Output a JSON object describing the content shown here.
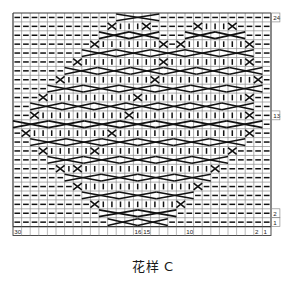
{
  "figure": {
    "caption": "花样 C",
    "type": "knitting-stitch-chart",
    "title_label": "花样 C"
  },
  "chart_data": {
    "type": "heatmap",
    "title": "花样 C",
    "subtitle": "",
    "xlabel": "",
    "ylabel": "",
    "grid": true,
    "legend_position": "none",
    "columns": 30,
    "rows": 24,
    "cell_width": 8.6,
    "cell_height": 8.9,
    "origin_x": 13,
    "origin_y": 13,
    "axis_note": "Stitch columns numbered right-to-left 1..30; rows numbered bottom-to-top 1..24",
    "colors": {
      "grid_line": "#8c8c8c",
      "grid_line_major": "#3a3a3a",
      "symbol": "#111111",
      "background": "#ffffff",
      "label_text": "#1a1a1a"
    },
    "column_tick_labels": [
      {
        "text": "30",
        "column": 30
      },
      {
        "text": "16",
        "column": 16
      },
      {
        "text": "15",
        "column": 15
      },
      {
        "text": "10",
        "column": 10
      },
      {
        "text": "2",
        "column": 2
      },
      {
        "text": "1",
        "column": 1
      }
    ],
    "row_tick_labels": [
      {
        "text": "24",
        "row": 24
      },
      {
        "text": "13",
        "row": 13
      },
      {
        "text": "2",
        "row": 2
      },
      {
        "text": "1",
        "row": 1
      }
    ],
    "symbols_legend": [
      {
        "key": "purl",
        "glyph": "dash",
        "description": "horizontal dash — purl stitch"
      },
      {
        "key": "knit",
        "glyph": "bar",
        "description": "vertical bar — knit stitch"
      },
      {
        "key": "cable",
        "glyph": "cross",
        "description": "crossing lines — cable cross over 4 stitches"
      }
    ],
    "cells": [
      "------------KXXXK-------------",
      "-----------K|||K-----K|||K----",
      "----------KXXXXXK---KXXXXXK---",
      "---------K|||||||K-K|||||||K--",
      "--------KXXXXXXXXKXXXXXXXXXK--",
      "-------K|||||||||K|||||||||K--",
      "------KXXXXXXXXXXKXXXXXXXXXXK-",
      "-----K||||||||||K|||||||||||K-",
      "----KXXXXXXXXXXKXXXXXXXXXXXXK",
      "---K||||||||||K||||||||||||K--",
      "--KXXXXXXXXXXKXXXXXXXXXXXXXK--",
      "--K||||||||||K|||||||||||||K--",
      "KXXXXXXXXXXXKXXXXXXXXXXXXXXXK",
      "-K|||||||||K|||||||||||||||K--",
      "--KXXXXXXXKXXXXXXXXXXXXXXXK---",
      "---K|||||K|||||||||||||||K----",
      "----KXXXKXXXXXXXXXXXXXXXK-----",
      "-----K|K|||||||||||||||K------",
      "------KXXXXXXXXXXXXXXXK-------",
      "-------K|||||||||||||K--------",
      "--------KXXXXXXXXXXXK---------",
      "---------K|||||||||K----------",
      "----------KXXXXXXXK-----------",
      "-----------KXXXXXK------------"
    ],
    "cable_crossings_description": "Large X cable crosses spanning 4 stitch columns, arranged in two mirrored diamond/lattice motifs repeating across 30 stitches and 24 rows",
    "values_note": "Cell glyph map: '-' purl dash, '|' knit bar, 'K'/'X' occupied by cable cross lines"
  }
}
